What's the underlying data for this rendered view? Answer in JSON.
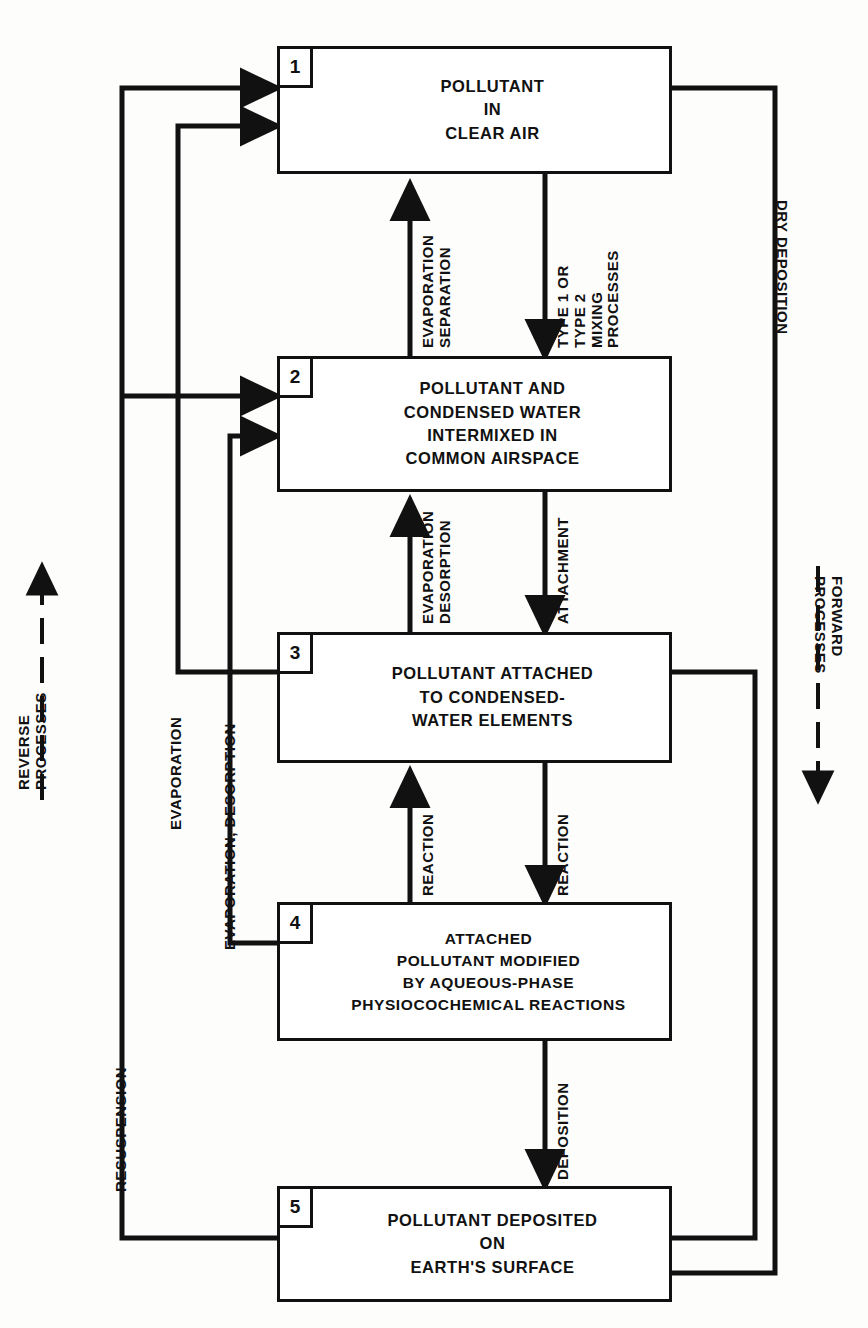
{
  "figure": {
    "type": "flowchart",
    "title_header": "",
    "orientation": "vertical top-to-bottom"
  },
  "boxes": [
    {
      "number": "1",
      "lines": [
        "POLLUTANT",
        "IN",
        "CLEAR AIR"
      ]
    },
    {
      "number": "2",
      "lines": [
        "POLLUTANT AND",
        "CONDENSED WATER",
        "INTERMIXED IN",
        "COMMON AIRSPACE"
      ]
    },
    {
      "number": "3",
      "lines": [
        "POLLUTANT ATTACHED",
        "TO CONDENSED-",
        "WATER ELEMENTS"
      ]
    },
    {
      "number": "4",
      "lines": [
        "ATTACHED",
        "POLLUTANT MODIFIED",
        "BY AQUEOUS-PHASE",
        "PHYSIOCOCHEMICAL REACTIONS"
      ]
    },
    {
      "number": "5",
      "lines": [
        "POLLUTANT DEPOSITED",
        "ON",
        "EARTH'S SURFACE"
      ]
    }
  ],
  "edge_labels": {
    "evaporation_separation": [
      "EVAPORATION",
      "SEPARATION"
    ],
    "type_mixing": [
      "TYPE 1 OR",
      "TYPE 2",
      "MIXING",
      "PROCESSES"
    ],
    "evaporation_desorption": [
      "EVAPORATION",
      "DESORPTION"
    ],
    "attachment": [
      "ATTACHMENT"
    ],
    "reaction_up": [
      "REACTION"
    ],
    "reaction_down": [
      "REACTION"
    ],
    "deposition": [
      "DEPOSITION"
    ],
    "dry_deposition": [
      "DRY DEPOSITION"
    ],
    "evaporation": [
      "EVAPORATION"
    ],
    "evaporation_desorption_long": [
      "EVAPORATION, DESORPTION"
    ],
    "resuspension": [
      "RESUSPENSION"
    ]
  },
  "legend": {
    "reverse": [
      "REVERSE",
      "PROCESSES"
    ],
    "forward": [
      "FORWARD",
      "PROCESSES"
    ]
  },
  "colors": {
    "ink": "#111111",
    "paper": "#fdfdfc"
  }
}
